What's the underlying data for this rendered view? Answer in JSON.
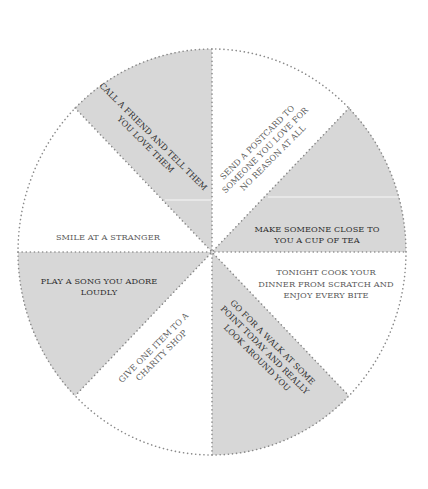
{
  "wheel": {
    "center": [
      212,
      252
    ],
    "radius_x": 194,
    "radius_y": 203,
    "colors": {
      "shaded_fill": "#d7d7d7",
      "plain_fill": "#ffffff",
      "dotted_line": "#8a8a8a",
      "dark_text": "#2e2e2e",
      "light_text": "#5a5a5a"
    },
    "segments": [
      {
        "id": "call-friend",
        "shaded": true,
        "lines": [
          "CALL A FRIEND AND TELL THEM",
          "YOU LOVE THEM"
        ]
      },
      {
        "id": "send-postcard",
        "shaded": false,
        "lines": [
          "SEND A POSTCARD TO",
          "SOMEONE YOU LOVE FOR",
          "NO REASON AT ALL"
        ]
      },
      {
        "id": "make-tea",
        "shaded": true,
        "lines": [
          "MAKE SOMEONE CLOSE TO",
          "YOU A CUP OF TEA"
        ]
      },
      {
        "id": "cook-dinner",
        "shaded": false,
        "lines": [
          "TONIGHT COOK YOUR",
          "DINNER FROM SCRATCH AND",
          "ENJOY EVERY BITE"
        ]
      },
      {
        "id": "go-for-walk",
        "shaded": true,
        "lines": [
          "GO FOR A WALK AT SOME",
          "POINT TODAY AND REALLY",
          "LOOK AROUND YOU"
        ]
      },
      {
        "id": "give-item",
        "shaded": false,
        "lines": [
          "GIVE ONE ITEM TO A",
          "CHARITY SHOP"
        ]
      },
      {
        "id": "play-song",
        "shaded": true,
        "lines": [
          "PLAY A SONG YOU ADORE",
          "LOUDLY"
        ]
      },
      {
        "id": "smile-stranger",
        "shaded": false,
        "lines": [
          "SMILE AT A STRANGER"
        ]
      }
    ]
  }
}
